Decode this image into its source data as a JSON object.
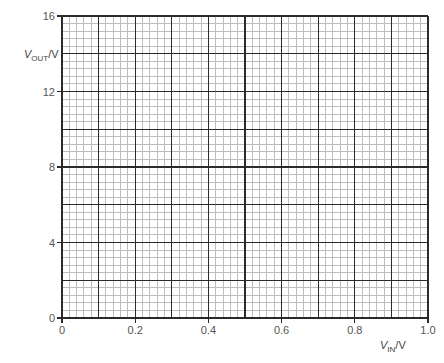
{
  "chart_data": {
    "type": "scatter",
    "title": "",
    "xlabel": "V_IN/V",
    "ylabel": "V_OUT/V",
    "xlim": [
      0,
      1.0
    ],
    "ylim": [
      0,
      16
    ],
    "x_ticks": [
      "0",
      "0.2",
      "0.4",
      "0.6",
      "0.8",
      "1.0"
    ],
    "y_ticks": [
      "0",
      "4",
      "8",
      "12",
      "16"
    ],
    "grid": {
      "on": true,
      "major_x_step": 0.1,
      "major_y_step": 2,
      "minor_subdivisions": 5
    },
    "series": [],
    "note": "Blank graph paper grid with no plotted data"
  },
  "axes": {
    "y_label": {
      "main": "V",
      "sub": "OUT",
      "unit": "/V"
    },
    "x_label": {
      "main": "V",
      "sub": "IN",
      "unit": "/V"
    }
  },
  "colors": {
    "major_grid": "#2b2b2b",
    "minor_grid": "#bdbdbd",
    "axis": "#2b2b2b",
    "text": "#555555"
  }
}
